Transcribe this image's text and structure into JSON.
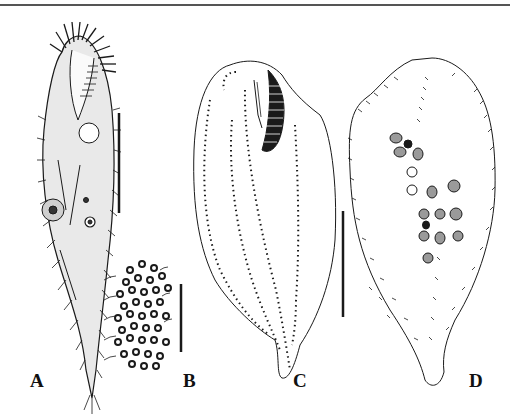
{
  "figure": {
    "panels": [
      {
        "id": "A",
        "label": "A",
        "description": "live ciliate, ventral view, elongate body with tail, cirri and adoral zone"
      },
      {
        "id": "B",
        "label": "B",
        "description": "cortical granules with cilia"
      },
      {
        "id": "C",
        "label": "C",
        "description": "ventral infraciliature, protargol"
      },
      {
        "id": "D",
        "label": "D",
        "description": "dorsal kineties and nuclear apparatus"
      }
    ],
    "scale_bars": [
      {
        "panel": "A",
        "x": 119,
        "y1": 113,
        "y2": 213
      },
      {
        "panel": "B",
        "x": 181,
        "y1": 284,
        "y2": 352
      },
      {
        "panel": "C-D",
        "x": 343,
        "y1": 211,
        "y2": 317
      }
    ],
    "colors": {
      "ink": "#1a1a1a",
      "background": "#ffffff",
      "rule": "#555555"
    }
  }
}
